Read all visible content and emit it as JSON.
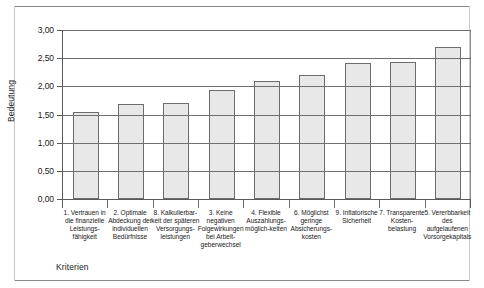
{
  "chart_data": {
    "type": "bar",
    "title": "",
    "xlabel": "Kriterien",
    "ylabel": "Bedeutung",
    "ylim": [
      0,
      3.0
    ],
    "ytick_step": 0.5,
    "ytick_labels": [
      "0,00",
      "0,50",
      "1,00",
      "1,50",
      "2,00",
      "2,50",
      "3,00"
    ],
    "ytick_values": [
      0,
      0.5,
      1.0,
      1.5,
      2.0,
      2.5,
      3.0
    ],
    "grid": true,
    "legend": "none",
    "bar_fill": "#e8e8e8",
    "bar_edge": "#6c6c6c",
    "categories": [
      "1. Vertrauen in die finanzielle Leistungs-fähigkeit",
      "2. Optimale Abdeckung der individuellen Bedürfnisse",
      "8. Kalkulierbar-keit der späteren Versorgungs-leistungen",
      "3. Keine negativen Folgewirkungen bei Arbeit-geberwechsel",
      "4. Flexible Auszahlungs-möglich-keiten",
      "6. Möglichst geringe Absicherungs-kosten",
      "9. Inflatorische Sicherheit",
      "7. Transparente Kosten-belastung",
      "5. Vererbbarkeit des aufgelaufenen Vorsorgekapitals"
    ],
    "values": [
      1.55,
      1.68,
      1.71,
      1.94,
      2.1,
      2.2,
      2.41,
      2.44,
      2.69
    ]
  }
}
